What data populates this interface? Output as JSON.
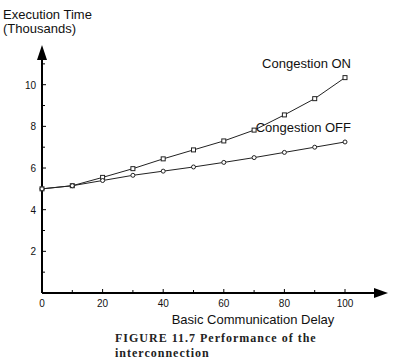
{
  "chart_data": {
    "type": "line",
    "title": "",
    "ylabel_line1": "Execution Time",
    "ylabel_line2": "(Thousands)",
    "xlabel": "Basic Communication Delay",
    "x": [
      0,
      10,
      20,
      30,
      40,
      50,
      60,
      70,
      80,
      90,
      100
    ],
    "xlim": [
      0,
      110
    ],
    "ylim": [
      0,
      11.5
    ],
    "xticks_major": [
      0,
      20,
      40,
      60,
      80,
      100
    ],
    "xticks_minor": [
      10,
      30,
      50,
      70,
      90
    ],
    "yticks_major": [
      2,
      4,
      6,
      8,
      10
    ],
    "yticks_minor": [
      1,
      3,
      5,
      7,
      9,
      11
    ],
    "grid": false,
    "series": [
      {
        "name": "Congestion ON",
        "marker": "square",
        "values": [
          5.0,
          5.15,
          5.55,
          5.97,
          6.44,
          6.87,
          7.3,
          7.82,
          8.55,
          9.33,
          10.34
        ]
      },
      {
        "name": "Congestion OFF",
        "marker": "circle",
        "values": [
          5.0,
          5.15,
          5.4,
          5.65,
          5.85,
          6.05,
          6.27,
          6.5,
          6.75,
          7.0,
          7.25
        ]
      }
    ],
    "caption": "FIGURE 11.7  Performance of the interconnection"
  }
}
